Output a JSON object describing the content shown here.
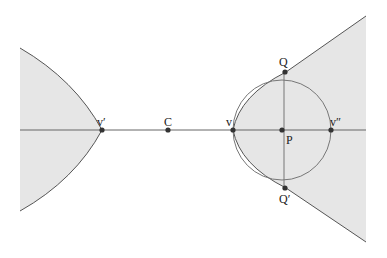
{
  "diagram": {
    "colors": {
      "fill": "#e6e6e6",
      "stroke": "#555555",
      "point": "#333333"
    },
    "points": [
      {
        "id": "v_prime",
        "label": "v′",
        "x": 102,
        "y": 130,
        "lx": 97,
        "ly": 116
      },
      {
        "id": "C",
        "label": "C",
        "x": 168,
        "y": 130,
        "lx": 164,
        "ly": 116
      },
      {
        "id": "v",
        "label": "v",
        "x": 233,
        "y": 130,
        "lx": 226,
        "ly": 116
      },
      {
        "id": "P",
        "label": "P",
        "x": 282,
        "y": 130,
        "lx": 285,
        "ly": 133
      },
      {
        "id": "v_double_prime",
        "label": "v″",
        "x": 331,
        "y": 130,
        "lx": 330,
        "ly": 116
      },
      {
        "id": "Q",
        "label": "Q",
        "x": 286,
        "y": 72,
        "lx": 280,
        "ly": 55
      },
      {
        "id": "Q_prime",
        "label": "Q′",
        "x": 286,
        "y": 188,
        "lx": 280,
        "ly": 193
      }
    ]
  }
}
